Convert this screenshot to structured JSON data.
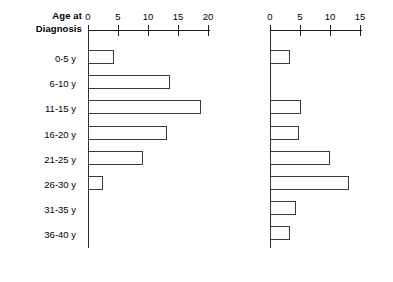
{
  "axis_title": {
    "line1": "Age at",
    "line2": "Diagnosis"
  },
  "categories": [
    "0-5 y",
    "6-10 y",
    "11-15 y",
    "16-20 y",
    "21-25 y",
    "26-30 y",
    "31-35 y",
    "36-40 y"
  ],
  "left_panel": {
    "ticks": [
      "0",
      "5",
      "10",
      "15",
      "20"
    ]
  },
  "right_panel": {
    "ticks": [
      "0",
      "5",
      "10",
      "15"
    ]
  },
  "chart_data": [
    {
      "type": "bar",
      "orientation": "horizontal",
      "panel": "left",
      "title": "",
      "xlabel": "",
      "ylabel": "Age at Diagnosis",
      "categories": [
        "0-5 y",
        "6-10 y",
        "11-15 y",
        "16-20 y",
        "21-25 y",
        "26-30 y",
        "31-35 y",
        "36-40 y"
      ],
      "values": [
        4.2,
        13.5,
        18.5,
        13.0,
        9.0,
        2.5,
        0,
        0
      ],
      "xlim": [
        0,
        20
      ],
      "xticks": [
        0,
        5,
        10,
        15,
        20
      ],
      "grid": false,
      "legend": false
    },
    {
      "type": "bar",
      "orientation": "horizontal",
      "panel": "right",
      "title": "",
      "xlabel": "",
      "ylabel": "Age at Diagnosis",
      "categories": [
        "0-5 y",
        "6-10 y",
        "11-15 y",
        "16-20 y",
        "21-25 y",
        "26-30 y",
        "31-35 y",
        "36-40 y"
      ],
      "values": [
        3.2,
        0,
        5.0,
        4.8,
        9.8,
        12.9,
        4.2,
        3.2
      ],
      "xlim": [
        0,
        15
      ],
      "xticks": [
        0,
        5,
        10,
        15
      ],
      "grid": false,
      "legend": false
    }
  ]
}
